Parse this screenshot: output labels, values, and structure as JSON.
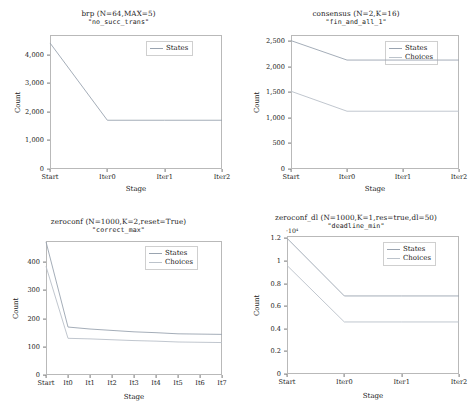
{
  "figure": {
    "width": 475,
    "height": 416,
    "background": "#ffffff",
    "layout": "2x2 grid of line charts",
    "series_colors": {
      "states": "#9aa4b0",
      "choices": "#b9c0c8"
    },
    "axis_color": "#b9b9b9"
  },
  "chart_data": [
    {
      "type": "line",
      "title": "brp (N=64,MAX=5)",
      "subtitle": "\"no_succ_trans\"",
      "xlabel": "Stage",
      "ylabel": "Count",
      "categories": [
        "Start",
        "Iter0",
        "Iter1",
        "Iter2"
      ],
      "ylim": [
        0,
        4700
      ],
      "yticks": [
        0,
        1000,
        2000,
        3000,
        4000
      ],
      "ytick_labels": [
        "0",
        "1,000",
        "2,000",
        "3,000",
        "4,000"
      ],
      "grid": false,
      "legend_position": "top-right",
      "series": [
        {
          "name": "States",
          "values": [
            4420,
            1710,
            1710,
            1710
          ]
        }
      ]
    },
    {
      "type": "line",
      "title": "consensus (N=2,K=16)",
      "subtitle": "\"fin_and_all_1\"",
      "xlabel": "Stage",
      "ylabel": "Count",
      "categories": [
        "Start",
        "Iter0",
        "Iter1",
        "Iter2"
      ],
      "ylim": [
        0,
        2620
      ],
      "yticks": [
        0,
        500,
        1000,
        1500,
        2000,
        2500
      ],
      "ytick_labels": [
        "0",
        "500",
        "1,000",
        "1,500",
        "2,000",
        "2,500"
      ],
      "grid": false,
      "legend_position": "top-right",
      "series": [
        {
          "name": "States",
          "values": [
            2510,
            2130,
            2130,
            2130
          ]
        },
        {
          "name": "Choices",
          "values": [
            1520,
            1130,
            1130,
            1130
          ]
        }
      ]
    },
    {
      "type": "line",
      "title": "zeroconf (N=1000,K=2,reset=True)",
      "subtitle": "\"correct_max\"",
      "xlabel": "Stage",
      "ylabel": "Count",
      "categories": [
        "Start",
        "It0",
        "It1",
        "It2",
        "It3",
        "It4",
        "It5",
        "It6",
        "It7"
      ],
      "ylim": [
        0,
        475
      ],
      "yticks": [
        0,
        100,
        200,
        300,
        400
      ],
      "ytick_labels": [
        "0",
        "100",
        "200",
        "300",
        "400"
      ],
      "grid": false,
      "legend_position": "top-right",
      "series": [
        {
          "name": "States",
          "values": [
            472,
            170,
            163,
            158,
            153,
            150,
            146,
            145,
            144
          ]
        },
        {
          "name": "Choices",
          "values": [
            385,
            130,
            128,
            125,
            122,
            120,
            117,
            116,
            115
          ]
        }
      ]
    },
    {
      "type": "line",
      "title": "zeroconf_dl (N=1000,K=1,res=true,dl=50)",
      "subtitle": "\"deadline_min\"",
      "xlabel": "Stage",
      "ylabel": "Count",
      "y_exponent": "·10⁴",
      "categories": [
        "Start",
        "Iter0",
        "Iter1",
        "Iter2"
      ],
      "ylim": [
        0,
        1.22
      ],
      "yticks": [
        0,
        0.2,
        0.4,
        0.6,
        0.8,
        1,
        1.2
      ],
      "ytick_labels": [
        "0",
        "0.2",
        "0.4",
        "0.6",
        "0.8",
        "1",
        "1.2"
      ],
      "grid": false,
      "legend_position": "top-right",
      "series": [
        {
          "name": "States",
          "values": [
            1.2,
            0.69,
            0.69,
            0.69
          ]
        },
        {
          "name": "Choices",
          "values": [
            0.96,
            0.46,
            0.46,
            0.46
          ]
        }
      ]
    }
  ]
}
